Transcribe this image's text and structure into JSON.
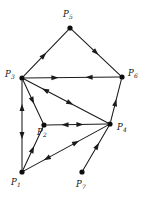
{
  "figure": {
    "type": "directed-graph",
    "width": 145,
    "height": 201,
    "background_color": "#ffffff",
    "line_color": "#1a1a1a",
    "node_color": "#0d0d0d",
    "label_color": "#111111"
  },
  "nodes": [
    {
      "id": "P1",
      "label_base": "P",
      "label_sub": "1",
      "x": 22,
      "y": 172,
      "radius": 2.6,
      "label_x": 11,
      "label_y": 178
    },
    {
      "id": "P2",
      "label_base": "P",
      "label_sub": "2",
      "x": 44,
      "y": 125,
      "radius": 2.6,
      "label_x": 37,
      "label_y": 128
    },
    {
      "id": "P3",
      "label_base": "P",
      "label_sub": "3",
      "x": 22,
      "y": 78,
      "radius": 2.6,
      "label_x": 5,
      "label_y": 70
    },
    {
      "id": "P4",
      "label_base": "P",
      "label_sub": "4",
      "x": 110,
      "y": 124,
      "radius": 2.6,
      "label_x": 117,
      "label_y": 123
    },
    {
      "id": "P5",
      "label_base": "P",
      "label_sub": "5",
      "x": 70,
      "y": 28,
      "radius": 2.6,
      "label_x": 63,
      "label_y": 10
    },
    {
      "id": "P6",
      "label_base": "P",
      "label_sub": "6",
      "x": 122,
      "y": 77,
      "radius": 2.6,
      "label_x": 128,
      "label_y": 69
    },
    {
      "id": "P7",
      "label_base": "P",
      "label_sub": "7",
      "x": 82,
      "y": 172,
      "radius": 2.6,
      "label_x": 76,
      "label_y": 180
    }
  ],
  "edges": [
    {
      "id": "e-p3-p5",
      "from": "P3",
      "to": "P5",
      "directed": "forward",
      "arrow_t": 0.45
    },
    {
      "id": "e-p5-p6",
      "from": "P5",
      "to": "P6",
      "directed": "forward",
      "arrow_t": 0.5
    },
    {
      "id": "e-p3-p6",
      "from": "P3",
      "to": "P6",
      "directed": "both",
      "arrow_t": 0.32,
      "arrow_t_back": 0.68
    },
    {
      "id": "e-p4-p6",
      "from": "P4",
      "to": "P6",
      "directed": "forward",
      "arrow_t": 0.45
    },
    {
      "id": "e-p1-p3",
      "from": "P1",
      "to": "P3",
      "directed": "both",
      "arrow_t": 0.7,
      "arrow_t_back": 0.38
    },
    {
      "id": "e-p3-p2",
      "from": "P3",
      "to": "P2",
      "directed": "forward",
      "arrow_t": 0.48
    },
    {
      "id": "e-p3-p4",
      "from": "P3",
      "to": "P4",
      "directed": "both",
      "arrow_t": 0.55,
      "arrow_t_back": 0.25
    },
    {
      "id": "e-p1-p2",
      "from": "P1",
      "to": "P2",
      "directed": "forward",
      "arrow_t": 0.48
    },
    {
      "id": "e-p2-p4",
      "from": "P2",
      "to": "P4",
      "directed": "both",
      "arrow_t": 0.55,
      "arrow_t_back": 0.3
    },
    {
      "id": "e-p1-p4",
      "from": "P1",
      "to": "P4",
      "directed": "both",
      "arrow_t": 0.62,
      "arrow_t_back": 0.27
    },
    {
      "id": "e-p7-p4",
      "from": "P7",
      "to": "P4",
      "directed": "forward",
      "arrow_t": 0.55
    }
  ],
  "style": {
    "arrow_length": 7.2,
    "arrow_half_width": 2.5,
    "stroke_width": 1.05
  }
}
